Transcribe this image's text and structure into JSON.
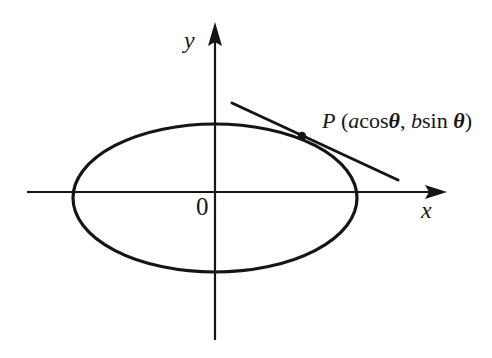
{
  "figure": {
    "type": "geometry-diagram",
    "background_color": "#ffffff",
    "stroke_color": "#151515",
    "axes": {
      "x_label": "x",
      "y_label": "y",
      "origin_label": "0",
      "x_axis": {
        "x1": 27,
        "y1": 192,
        "x2": 447,
        "y2": 192,
        "arrow": "right"
      },
      "y_axis": {
        "x1": 215,
        "y1": 340,
        "x2": 215,
        "y2": 22,
        "arrow": "up"
      }
    },
    "ellipse": {
      "center_x": 215,
      "center_y": 198,
      "semi_axis_a": 142,
      "semi_axis_b": 74,
      "stroke_width": 3.2
    },
    "tangent_line": {
      "x1": 232,
      "y1": 103,
      "x2": 398,
      "y2": 180,
      "stroke_width": 3
    },
    "point": {
      "cx": 302,
      "cy": 136,
      "r": 4.2,
      "label_P": "P",
      "label_open": "(",
      "label_a": "a",
      "label_cos": "cos",
      "label_theta1": "θ",
      "label_comma": ", ",
      "label_b": "b",
      "label_sin": "sin",
      "label_theta2": "θ",
      "label_close": ")",
      "label_full": "P (acosθ, bsin θ)"
    }
  }
}
